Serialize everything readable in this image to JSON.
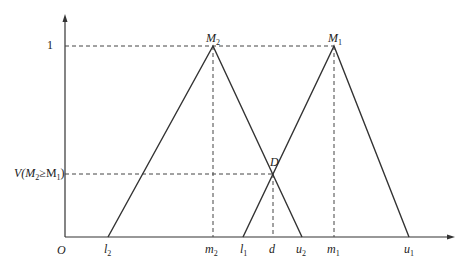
{
  "diagram": {
    "type": "fuzzy-triangular-membership-comparison",
    "axis": {
      "origin_label": "O",
      "y_tick_one": "1",
      "y_tick_v": {
        "text": "V(M",
        "sub1": "2",
        "mid": "≥M",
        "sub2": "1",
        "end": ")"
      }
    },
    "points": {
      "M2": {
        "text": "M",
        "sub": "2"
      },
      "M1": {
        "text": "M",
        "sub": "1"
      },
      "D": {
        "text": "D"
      }
    },
    "x_labels": {
      "l2": {
        "text": "l",
        "sub": "2"
      },
      "m2": {
        "text": "m",
        "sub": "2"
      },
      "l1": {
        "text": "l",
        "sub": "1"
      },
      "d": {
        "text": "d"
      },
      "u2": {
        "text": "u",
        "sub": "2"
      },
      "m1": {
        "text": "m",
        "sub": "1"
      },
      "u1": {
        "text": "u",
        "sub": "1"
      }
    }
  }
}
